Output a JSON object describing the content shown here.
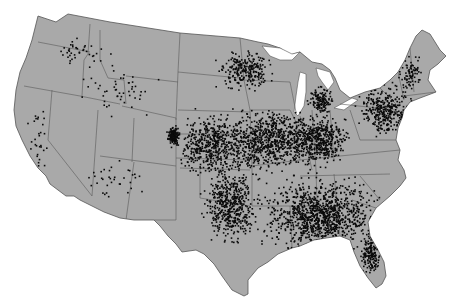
{
  "map": {
    "title": "",
    "region": "Contiguous United States",
    "style": {
      "land_color": "#a9a9a9",
      "border_color": "#555555",
      "dot_color": "#0a0a0a",
      "background": "#ffffff"
    },
    "point_density_regions": [
      {
        "name": "southeast",
        "cx": 320,
        "cy": 215,
        "rx": 70,
        "ry": 45,
        "count": 1100
      },
      {
        "name": "midwest",
        "cx": 270,
        "cy": 140,
        "rx": 60,
        "ry": 40,
        "count": 800
      },
      {
        "name": "plains-kansas-nebraska",
        "cx": 210,
        "cy": 145,
        "rx": 40,
        "ry": 40,
        "count": 500
      },
      {
        "name": "colorado-denver-cluster",
        "cx": 173,
        "cy": 135,
        "rx": 8,
        "ry": 12,
        "count": 160
      },
      {
        "name": "ohio-valley",
        "cx": 320,
        "cy": 140,
        "rx": 35,
        "ry": 30,
        "count": 450
      },
      {
        "name": "texas-oklahoma",
        "cx": 230,
        "cy": 205,
        "rx": 35,
        "ry": 45,
        "count": 500
      },
      {
        "name": "northeast",
        "cx": 385,
        "cy": 110,
        "rx": 35,
        "ry": 30,
        "count": 350
      },
      {
        "name": "michigan",
        "cx": 320,
        "cy": 100,
        "rx": 14,
        "ry": 18,
        "count": 140
      },
      {
        "name": "upper-midwest",
        "cx": 245,
        "cy": 70,
        "rx": 35,
        "ry": 25,
        "count": 250
      },
      {
        "name": "florida",
        "cx": 370,
        "cy": 255,
        "rx": 12,
        "ry": 28,
        "count": 160
      },
      {
        "name": "new-england",
        "cx": 410,
        "cy": 75,
        "rx": 15,
        "ry": 25,
        "count": 80
      },
      {
        "name": "northwest",
        "cx": 80,
        "cy": 50,
        "rx": 40,
        "ry": 20,
        "count": 40
      },
      {
        "name": "mountain-west",
        "cx": 120,
        "cy": 90,
        "rx": 50,
        "ry": 35,
        "count": 50
      },
      {
        "name": "california",
        "cx": 40,
        "cy": 140,
        "rx": 15,
        "ry": 40,
        "count": 30
      },
      {
        "name": "southwest",
        "cx": 120,
        "cy": 180,
        "rx": 45,
        "ry": 25,
        "count": 35
      }
    ]
  }
}
